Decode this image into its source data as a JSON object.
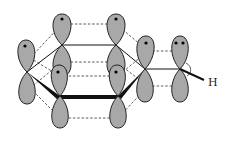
{
  "diagram": {
    "type": "molecular-orbital-diagram",
    "labels": {
      "hydrogen": "H"
    },
    "colors": {
      "lobe_fill": "#a8a8a8",
      "outline": "#222222",
      "background": "#ffffff"
    },
    "atoms": [
      {
        "id": "ring-back-left",
        "x": 62,
        "y": 45,
        "electrons_top": 1
      },
      {
        "id": "ring-back-right",
        "x": 116,
        "y": 45,
        "electrons_top": 1
      },
      {
        "id": "ring-left",
        "x": 27,
        "y": 72,
        "electrons_top": 1
      },
      {
        "id": "ring-right",
        "x": 145,
        "y": 69,
        "electrons_top": 1
      },
      {
        "id": "ring-front-left",
        "x": 60,
        "y": 96,
        "electrons_top": 1
      },
      {
        "id": "ring-front-right",
        "x": 118,
        "y": 96,
        "electrons_top": 1
      },
      {
        "id": "exocyclic",
        "x": 180,
        "y": 69,
        "electrons_top": 2
      }
    ]
  }
}
